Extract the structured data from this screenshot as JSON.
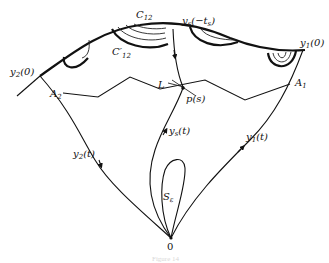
{
  "figure": {
    "caption": "Figure 14",
    "labels": {
      "C12": {
        "main": "C",
        "sub": "12"
      },
      "C12_prime": {
        "main": "C′",
        "sub": "12"
      },
      "ys_neg_ts": {
        "main": "y",
        "sub": "s",
        "rest": "(−t",
        "rest_sub": "s",
        "close": ")"
      },
      "y1_0": {
        "main": "y",
        "sub": "1",
        "rest": "(0)"
      },
      "y2_0": {
        "main": "y",
        "sub": "2",
        "rest": "(0)"
      },
      "A1": {
        "main": "A",
        "sub": "1"
      },
      "A2": {
        "main": "A",
        "sub": "2"
      },
      "L": {
        "main": "L"
      },
      "p_s": {
        "main": "p(s)"
      },
      "ys_t": {
        "main": "y",
        "sub": "s",
        "rest": "(t)"
      },
      "y1_t": {
        "main": "y",
        "sub": "1",
        "rest": "(t)"
      },
      "y2_t": {
        "main": "y",
        "sub": "2",
        "rest": "(t)"
      },
      "S_eps": {
        "main": "S",
        "sub": "ε"
      },
      "origin": {
        "main": "0"
      }
    }
  }
}
